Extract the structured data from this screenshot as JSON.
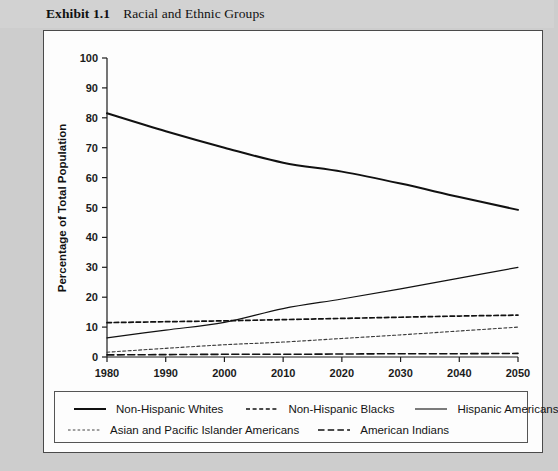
{
  "exhibit": {
    "number": "Exhibit 1.1",
    "title": "Racial and Ethnic Groups"
  },
  "colors": {
    "page_background": "#cdcdcd",
    "panel_background": "#fdfdfd",
    "panel_border": "#4a4a4a",
    "line": "#111111",
    "text": "#111111"
  },
  "chart_data": {
    "type": "line",
    "title": "Racial and Ethnic Groups",
    "xlabel": "",
    "ylabel": "Percentage of Total Population",
    "xlim": [
      1980,
      2050
    ],
    "ylim": [
      0,
      100
    ],
    "grid": false,
    "legend_position": "bottom",
    "x": [
      1980,
      1990,
      2000,
      2010,
      2020,
      2030,
      2040,
      2050
    ],
    "xticks": [
      "1980",
      "1990",
      "2000",
      "2010",
      "2020",
      "2030",
      "2040",
      "2050"
    ],
    "yticks": [
      "0",
      "10",
      "20",
      "30",
      "40",
      "50",
      "60",
      "70",
      "80",
      "90",
      "100"
    ],
    "series": [
      {
        "name": "Non-Hispanic Whites",
        "style": "solid-thick",
        "values": [
          81.5,
          75.5,
          70.0,
          65.0,
          62.0,
          58.0,
          53.5,
          49.2
        ]
      },
      {
        "name": "Non-Hispanic  Blacks",
        "style": "dashed",
        "values": [
          11.5,
          11.8,
          12.1,
          12.5,
          12.9,
          13.3,
          13.7,
          14.0
        ]
      },
      {
        "name": "Hispanic Americans",
        "style": "solid-thin",
        "values": [
          6.4,
          9.0,
          11.6,
          16.2,
          19.4,
          22.8,
          26.4,
          30.0
        ]
      },
      {
        "name": "Asian and Pacific Islander Americans",
        "style": "fine-dashed",
        "values": [
          1.6,
          2.9,
          4.1,
          5.0,
          6.2,
          7.4,
          8.7,
          10.0
        ]
      },
      {
        "name": "American Indians",
        "style": "long-dashed",
        "values": [
          0.7,
          0.8,
          0.9,
          0.9,
          1.0,
          1.1,
          1.1,
          1.2
        ]
      }
    ]
  },
  "legend": {
    "row1": [
      {
        "label": "Non-Hispanic Whites",
        "style": "solid-thick"
      },
      {
        "label": "Non-Hispanic  Blacks",
        "style": "dashed"
      },
      {
        "label": "Hispanic Americans",
        "style": "solid-thin"
      }
    ],
    "row2": [
      {
        "label": "Asian and Pacific Islander Americans",
        "style": "fine-dashed"
      },
      {
        "label": "American Indians",
        "style": "long-dashed"
      }
    ]
  }
}
